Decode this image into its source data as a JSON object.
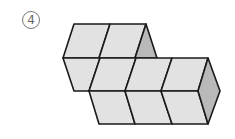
{
  "figure": {
    "label": "4",
    "colors": {
      "face": "#e2e2e2",
      "side": "#b9b9b9",
      "stroke": "#1a1a1a",
      "label": "#666666"
    }
  }
}
